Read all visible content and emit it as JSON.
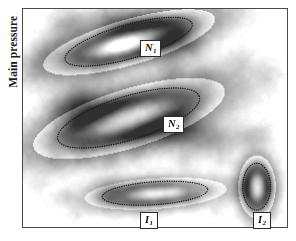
{
  "figure": {
    "axis": {
      "ylabel": "Main pressure",
      "xlabel": ""
    },
    "frame": {
      "border_color": "#4a4a4a",
      "background": "#fdfdfd"
    },
    "colormap": "grayscale",
    "features": [
      {
        "id": "N1",
        "label_main": "N",
        "label_sub": "1",
        "shape": "ellipse",
        "outline": "dotted",
        "orientation_deg": -16,
        "center_pct": {
          "x": 0.4,
          "y": 0.15
        },
        "size_pct": {
          "w": 0.5,
          "h": 0.155
        },
        "label_pos_px": {
          "x": 140,
          "y": 40
        },
        "fill": "dark-core-bright-center"
      },
      {
        "id": "N2",
        "label_main": "N",
        "label_sub": "2",
        "shape": "ellipse",
        "outline": "dotted",
        "orientation_deg": -17,
        "center_pct": {
          "x": 0.4,
          "y": 0.5
        },
        "size_pct": {
          "w": 0.56,
          "h": 0.2
        },
        "label_pos_px": {
          "x": 163,
          "y": 116
        },
        "fill": "dark-ring-bright-center"
      },
      {
        "id": "I1",
        "label_main": "I",
        "label_sub": "1",
        "shape": "ellipse",
        "outline": "dotted",
        "orientation_deg": -4,
        "center_pct": {
          "x": 0.5,
          "y": 0.845
        },
        "size_pct": {
          "w": 0.4,
          "h": 0.105
        },
        "label_pos_px": {
          "x": 140,
          "y": 212
        },
        "fill": "mid-gray-elongated"
      },
      {
        "id": "I2",
        "label_main": "I",
        "label_sub": "2",
        "shape": "ellipse",
        "outline": "dotted",
        "orientation_deg": 0,
        "center_pct": {
          "x": 0.885,
          "y": 0.815
        },
        "size_pct": {
          "w": 0.105,
          "h": 0.215
        },
        "label_pos_px": {
          "x": 253,
          "y": 212
        },
        "fill": "dark-ring-light-center"
      }
    ],
    "colors": {
      "ink": "#111111",
      "frame": "#4a4a4a",
      "paper": "#ffffff",
      "plot_bg": "#fdfdfd",
      "dark_blob": "#4d4d4d",
      "mid_blob": "#8c8c8c",
      "faint_blob": "#d2d2d2"
    },
    "blobs": [
      {
        "cx": 0.155,
        "cy": 0.075,
        "r": 0.06,
        "v": 0.34
      },
      {
        "cx": 0.215,
        "cy": 0.055,
        "r": 0.048,
        "v": 0.22
      },
      {
        "cx": 0.3,
        "cy": 0.03,
        "r": 0.052,
        "v": 0.26
      },
      {
        "cx": 0.375,
        "cy": 0.06,
        "r": 0.07,
        "v": 0.3
      },
      {
        "cx": 0.47,
        "cy": 0.105,
        "r": 0.075,
        "v": 0.4
      },
      {
        "cx": 0.56,
        "cy": 0.145,
        "r": 0.065,
        "v": 0.36
      },
      {
        "cx": 0.64,
        "cy": 0.175,
        "r": 0.055,
        "v": 0.26
      },
      {
        "cx": 0.09,
        "cy": 0.175,
        "r": 0.055,
        "v": 0.2
      },
      {
        "cx": 0.055,
        "cy": 0.255,
        "r": 0.042,
        "v": 0.12
      },
      {
        "cx": 0.3,
        "cy": 0.3,
        "r": 0.048,
        "v": 0.14
      },
      {
        "cx": 0.56,
        "cy": 0.275,
        "r": 0.05,
        "v": 0.2
      },
      {
        "cx": 0.69,
        "cy": 0.31,
        "r": 0.046,
        "v": 0.15
      },
      {
        "cx": 0.82,
        "cy": 0.23,
        "r": 0.05,
        "v": 0.14
      },
      {
        "cx": 0.925,
        "cy": 0.3,
        "r": 0.046,
        "v": 0.12
      },
      {
        "cx": 0.21,
        "cy": 0.39,
        "r": 0.062,
        "v": 0.26
      },
      {
        "cx": 0.15,
        "cy": 0.455,
        "r": 0.07,
        "v": 0.34
      },
      {
        "cx": 0.25,
        "cy": 0.47,
        "r": 0.075,
        "v": 0.4
      },
      {
        "cx": 0.36,
        "cy": 0.5,
        "r": 0.08,
        "v": 0.44
      },
      {
        "cx": 0.47,
        "cy": 0.53,
        "r": 0.08,
        "v": 0.44
      },
      {
        "cx": 0.57,
        "cy": 0.555,
        "r": 0.075,
        "v": 0.42
      },
      {
        "cx": 0.66,
        "cy": 0.585,
        "r": 0.07,
        "v": 0.4
      },
      {
        "cx": 0.745,
        "cy": 0.6,
        "r": 0.058,
        "v": 0.34
      },
      {
        "cx": 0.835,
        "cy": 0.585,
        "r": 0.05,
        "v": 0.26
      },
      {
        "cx": 0.905,
        "cy": 0.57,
        "r": 0.044,
        "v": 0.2
      },
      {
        "cx": 0.12,
        "cy": 0.69,
        "r": 0.04,
        "v": 0.13
      },
      {
        "cx": 0.23,
        "cy": 0.67,
        "r": 0.044,
        "v": 0.16
      },
      {
        "cx": 0.33,
        "cy": 0.7,
        "r": 0.04,
        "v": 0.14
      },
      {
        "cx": 0.43,
        "cy": 0.675,
        "r": 0.038,
        "v": 0.12
      },
      {
        "cx": 0.61,
        "cy": 0.7,
        "r": 0.04,
        "v": 0.12
      },
      {
        "cx": 0.76,
        "cy": 0.69,
        "r": 0.036,
        "v": 0.1
      },
      {
        "cx": 0.06,
        "cy": 0.8,
        "r": 0.038,
        "v": 0.1
      },
      {
        "cx": 0.16,
        "cy": 0.86,
        "r": 0.036,
        "v": 0.1
      },
      {
        "cx": 0.32,
        "cy": 0.84,
        "r": 0.06,
        "v": 0.32
      },
      {
        "cx": 0.42,
        "cy": 0.855,
        "r": 0.062,
        "v": 0.34
      },
      {
        "cx": 0.52,
        "cy": 0.845,
        "r": 0.058,
        "v": 0.3
      },
      {
        "cx": 0.625,
        "cy": 0.87,
        "r": 0.04,
        "v": 0.18
      },
      {
        "cx": 0.885,
        "cy": 0.815,
        "r": 0.06,
        "v": 0.4
      },
      {
        "cx": 0.73,
        "cy": 0.93,
        "r": 0.034,
        "v": 0.09
      },
      {
        "cx": 0.2,
        "cy": 0.945,
        "r": 0.034,
        "v": 0.09
      }
    ]
  }
}
